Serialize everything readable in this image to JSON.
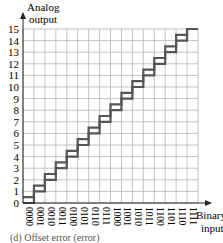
{
  "chart_data": {
    "type": "line",
    "title": "",
    "caption": "(d) Offset error (error)",
    "xlabel": "Binary input",
    "ylabel": "Analog output",
    "categories": [
      "0000",
      "0001",
      "0010",
      "0011",
      "0100",
      "0101",
      "0110",
      "0111",
      "1000",
      "1001",
      "1010",
      "1011",
      "1100",
      "1101",
      "1110",
      "1111"
    ],
    "yticks": [
      0,
      1,
      2,
      3,
      4,
      5,
      6,
      7,
      8,
      9,
      10,
      11,
      12,
      13,
      14,
      15
    ],
    "ylim": [
      0,
      15
    ],
    "grid": true,
    "series": [
      {
        "name": "Ideal",
        "values": [
          0,
          1,
          2,
          3,
          4,
          5,
          6,
          7,
          8,
          9,
          10,
          11,
          12,
          13,
          14,
          15
        ]
      },
      {
        "name": "Offset error",
        "values": [
          0.5,
          1.5,
          2.5,
          3.5,
          4.5,
          5.5,
          6.5,
          7.5,
          8.5,
          9.5,
          10.5,
          11.5,
          12.5,
          13.5,
          14.5,
          15
        ]
      }
    ],
    "colors": {
      "grid": "#b5b5b5",
      "line": "#555555",
      "axis": "#222222"
    }
  },
  "labels": {
    "ylabel_line1": "Analog",
    "ylabel_line2": "output",
    "xlabel_line1": "Binary",
    "xlabel_line2": "input",
    "caption": "(d) Offset error (error)"
  }
}
